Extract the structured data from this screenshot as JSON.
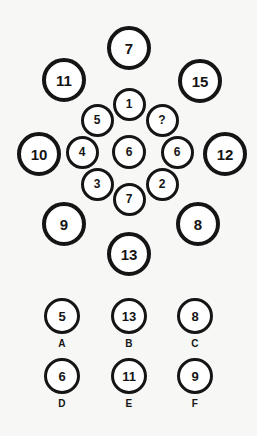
{
  "puzzle": {
    "center": {
      "value": "6",
      "cx": 129,
      "cy": 152,
      "d": 34
    },
    "inner_ring": [
      {
        "name": "inner-top",
        "value": "1",
        "cx": 129,
        "cy": 104,
        "d": 33
      },
      {
        "name": "inner-upper-right",
        "value": "?",
        "cx": 162,
        "cy": 120,
        "d": 33
      },
      {
        "name": "inner-right",
        "value": "6",
        "cx": 177,
        "cy": 152,
        "d": 33
      },
      {
        "name": "inner-lower-right",
        "value": "2",
        "cx": 162,
        "cy": 184,
        "d": 33
      },
      {
        "name": "inner-bottom",
        "value": "7",
        "cx": 129,
        "cy": 199,
        "d": 33
      },
      {
        "name": "inner-lower-left",
        "value": "3",
        "cx": 97,
        "cy": 184,
        "d": 33
      },
      {
        "name": "inner-left",
        "value": "4",
        "cx": 82,
        "cy": 152,
        "d": 33
      },
      {
        "name": "inner-upper-left",
        "value": "5",
        "cx": 97,
        "cy": 120,
        "d": 33
      }
    ],
    "outer_ring": [
      {
        "name": "outer-top",
        "value": "7",
        "cx": 129,
        "cy": 48,
        "d": 44
      },
      {
        "name": "outer-upper-right",
        "value": "15",
        "cx": 200,
        "cy": 81,
        "d": 44
      },
      {
        "name": "outer-right",
        "value": "12",
        "cx": 225,
        "cy": 154,
        "d": 44
      },
      {
        "name": "outer-lower-right",
        "value": "8",
        "cx": 198,
        "cy": 224,
        "d": 44
      },
      {
        "name": "outer-bottom",
        "value": "13",
        "cx": 129,
        "cy": 254,
        "d": 44
      },
      {
        "name": "outer-lower-left",
        "value": "9",
        "cx": 64,
        "cy": 224,
        "d": 44
      },
      {
        "name": "outer-left",
        "value": "10",
        "cx": 39,
        "cy": 154,
        "d": 44
      },
      {
        "name": "outer-upper-left",
        "value": "11",
        "cx": 64,
        "cy": 80,
        "d": 44
      }
    ]
  },
  "options": [
    {
      "label": "A",
      "value": "5",
      "x": 33,
      "y": 8
    },
    {
      "label": "B",
      "value": "13",
      "x": 100,
      "y": 8
    },
    {
      "label": "C",
      "value": "8",
      "x": 166,
      "y": 8
    },
    {
      "label": "D",
      "value": "6",
      "x": 33,
      "y": 68
    },
    {
      "label": "E",
      "value": "11",
      "x": 100,
      "y": 68
    },
    {
      "label": "F",
      "value": "9",
      "x": 166,
      "y": 68
    }
  ],
  "colors": {
    "background": "#f7f7f5",
    "stroke": "#151515",
    "fill": "#ffffff"
  }
}
